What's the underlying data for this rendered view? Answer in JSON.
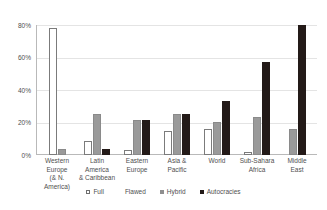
{
  "chart_data": {
    "type": "bar",
    "title": "",
    "xlabel": "",
    "ylabel": "",
    "ylim": [
      0,
      80
    ],
    "grid": true,
    "legend_position": "bottom",
    "categories": [
      "Western\nEurope\n(& N. America)",
      "Latin America\n& Caribbean",
      "Eastern\nEurope",
      "Asia &\nPacific",
      "World",
      "Sub-Sahara\nAfrica",
      "Middle\nEast"
    ],
    "ytick_labels": [
      "80%",
      "60%",
      "40%",
      "20%",
      "0%"
    ],
    "ytick_values": [
      80,
      60,
      40,
      20,
      0
    ],
    "series": [
      {
        "name": "Full",
        "values": [
          78,
          0,
          0,
          0,
          0,
          0,
          0
        ]
      },
      {
        "name": "Flawed",
        "values": [
          0,
          8.5,
          3,
          15,
          16,
          2,
          0
        ]
      },
      {
        "name": "Hybrid",
        "values": [
          4,
          25,
          21.5,
          25,
          20.5,
          23.5,
          16
        ]
      },
      {
        "name": "Autocracies",
        "values": [
          0,
          4,
          21.5,
          25,
          33.5,
          57.5,
          80
        ]
      }
    ]
  },
  "legend": {
    "items": [
      {
        "label": "Full",
        "swatch": "open-square-marker",
        "color": "#ffffff"
      },
      {
        "label": "Flawed",
        "swatch": "blank-marker",
        "color": "#ffffff"
      },
      {
        "label": "Hybrid",
        "swatch": "gray-square-marker",
        "color": "#8f8f8f"
      },
      {
        "label": "Autocracies",
        "swatch": "black-square-marker",
        "color": "#231a18"
      }
    ]
  }
}
